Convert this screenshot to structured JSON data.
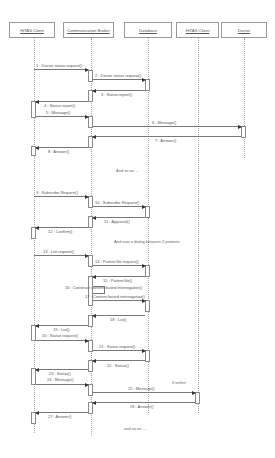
{
  "diagram": {
    "type": "UML sequence diagram",
    "actors": [
      {
        "id": "hitas_client_1",
        "label": "HiTAS Client"
      },
      {
        "id": "comm_broker",
        "label": "Communication Broker"
      },
      {
        "id": "database",
        "label": "Database"
      },
      {
        "id": "hitas_client_2",
        "label": "HiTAS Client"
      },
      {
        "id": "doctor",
        "label": "Doctor"
      }
    ],
    "messages": [
      {
        "n": 1,
        "label": "1 : Doctor status request()",
        "from": "hitas_client_1",
        "to": "comm_broker"
      },
      {
        "n": 2,
        "label": "2 : Doctor status request()",
        "from": "comm_broker",
        "to": "database"
      },
      {
        "n": 3,
        "label": "3 : Status report()",
        "from": "database",
        "to": "comm_broker"
      },
      {
        "n": 4,
        "label": "4 : Status report()",
        "from": "comm_broker",
        "to": "hitas_client_1"
      },
      {
        "n": 5,
        "label": "5 : Message()",
        "from": "hitas_client_1",
        "to": "comm_broker"
      },
      {
        "n": 6,
        "label": "6 : Message()",
        "from": "comm_broker",
        "to": "doctor"
      },
      {
        "n": 7,
        "label": "7 : Answer()",
        "from": "doctor",
        "to": "comm_broker"
      },
      {
        "n": 8,
        "label": "8 : Answer()",
        "from": "comm_broker",
        "to": "hitas_client_1"
      },
      {
        "n": 9,
        "label": "9 : Subscribe Request()",
        "from": "hitas_client_1",
        "to": "comm_broker"
      },
      {
        "n": 10,
        "label": "10 : Subscribe Request()",
        "from": "comm_broker",
        "to": "database"
      },
      {
        "n": 11,
        "label": "11 : Approval()",
        "from": "database",
        "to": "comm_broker"
      },
      {
        "n": 12,
        "label": "12 : Confirm()",
        "from": "comm_broker",
        "to": "hitas_client_1"
      },
      {
        "n": 13,
        "label": "13 : List request()",
        "from": "hitas_client_1",
        "to": "comm_broker"
      },
      {
        "n": 14,
        "label": "14 : Patient file request()",
        "from": "comm_broker",
        "to": "database"
      },
      {
        "n": 15,
        "label": "15 : Patient file()",
        "from": "database",
        "to": "comm_broker"
      },
      {
        "n": 16,
        "label": "16 : Construct content-based interrogation()",
        "from": "comm_broker",
        "to": "comm_broker"
      },
      {
        "n": 17,
        "label": "17 : Content-based interrogation()",
        "from": "comm_broker",
        "to": "database"
      },
      {
        "n": 18,
        "label": "18 : List()",
        "from": "database",
        "to": "comm_broker"
      },
      {
        "n": 19,
        "label": "19 : List()",
        "from": "comm_broker",
        "to": "hitas_client_1"
      },
      {
        "n": 20,
        "label": "20 : Status request()",
        "from": "hitas_client_1",
        "to": "comm_broker"
      },
      {
        "n": 21,
        "label": "21 : Status request()",
        "from": "comm_broker",
        "to": "database"
      },
      {
        "n": 22,
        "label": "22 : Status()",
        "from": "database",
        "to": "comm_broker"
      },
      {
        "n": 23,
        "label": "23 : Status()",
        "from": "comm_broker",
        "to": "hitas_client_1"
      },
      {
        "n": 24,
        "label": "24 : Message()",
        "from": "hitas_client_1",
        "to": "comm_broker"
      },
      {
        "n": 25,
        "label": "25 : Message()",
        "from": "comm_broker",
        "to": "hitas_client_2"
      },
      {
        "n": 26,
        "label": "26 : Answer()",
        "from": "hitas_client_2",
        "to": "comm_broker"
      },
      {
        "n": 27,
        "label": "27 : Answer()",
        "from": "comm_broker",
        "to": "hitas_client_1"
      }
    ],
    "notes": [
      {
        "id": "and_so_on_1",
        "text": "And so on ..."
      },
      {
        "id": "dialog_note",
        "text": "And now a dialog between 2 patients"
      },
      {
        "id": "if_online",
        "text": "If online"
      },
      {
        "id": "and_so_on_2",
        "text": "and so on ..."
      }
    ]
  }
}
